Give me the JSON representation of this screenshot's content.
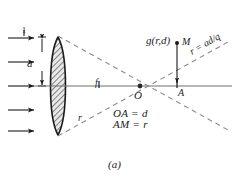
{
  "figure": {
    "caption": "(a)",
    "background_color": "#ffffff",
    "ink_color": "#1b1b1b",
    "lens": {
      "name": "biconvex-lens",
      "fill_pattern": "diagonal-hatch",
      "aperture_label": "a",
      "top_ray_label": "1"
    },
    "axis": {
      "focal_label": "f",
      "origin_label": "O",
      "point_label": "A",
      "image_point_label": "M"
    },
    "annotations": {
      "amplitude": "g(r,d)",
      "ray_label": "r",
      "slope_relation": "r = ad/q",
      "relation_1": "OA = d",
      "relation_2": "AM = r"
    },
    "incoming_rays": {
      "name": "incoming-plane-wave-arrows",
      "count": 5
    }
  }
}
